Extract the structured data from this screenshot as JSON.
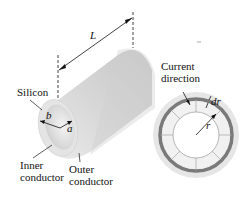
{
  "diagram": {
    "labels": {
      "length": "L",
      "silicon": "Silicon",
      "inner_radius": "a",
      "outer_radius": "b",
      "inner_conductor_1": "Inner",
      "inner_conductor_2": "conductor",
      "outer_conductor_1": "Outer",
      "outer_conductor_2": "conductor",
      "current_1": "Current",
      "current_2": "direction",
      "dr": "dr",
      "r": "r"
    },
    "colors": {
      "cylinder_body": "#d9d9d9",
      "cylinder_end": "#e8e8e8",
      "shell_ring": "#7a7a7a",
      "annulus": "#ebebeb",
      "line": "#111111"
    }
  }
}
